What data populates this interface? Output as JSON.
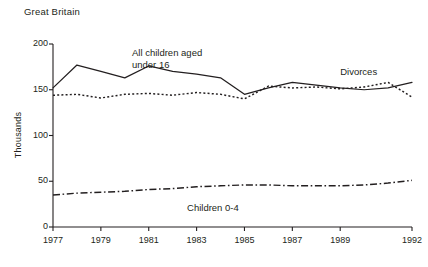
{
  "chart_data": {
    "type": "line",
    "title": "Great Britain",
    "xlabel": "",
    "ylabel": "Thousands",
    "xlim": [
      1977,
      1992
    ],
    "ylim": [
      0,
      200
    ],
    "grid": false,
    "legend_position": "inline-annotations",
    "y_ticks": [
      "0",
      "50",
      "100",
      "150",
      "200"
    ],
    "y_tick_values": [
      0,
      50,
      100,
      150,
      200
    ],
    "x_ticks": [
      "1977",
      "1979",
      "1981",
      "1983",
      "1985",
      "1987",
      "1989",
      "1992"
    ],
    "x_tick_values": [
      1977,
      1979,
      1981,
      1983,
      1985,
      1987,
      1989,
      1992
    ],
    "x": [
      1977,
      1978,
      1979,
      1980,
      1981,
      1982,
      1983,
      1984,
      1985,
      1986,
      1987,
      1988,
      1989,
      1990,
      1991,
      1992
    ],
    "series": [
      {
        "name": "All children aged under 16",
        "style": "solid",
        "color": "#231f20",
        "annotation": "All children aged\nunder 16",
        "values": [
          152,
          177,
          170,
          163,
          176,
          170,
          167,
          163,
          145,
          152,
          158,
          155,
          152,
          150,
          152,
          158
        ]
      },
      {
        "name": "Divorces",
        "style": "dotted",
        "color": "#231f20",
        "annotation": "Divorces",
        "values": [
          144,
          145,
          141,
          145,
          146,
          144,
          147,
          145,
          140,
          154,
          152,
          153,
          151,
          153,
          158,
          142
        ]
      },
      {
        "name": "Children 0-4",
        "style": "dash-dot",
        "color": "#231f20",
        "annotation": "Children 0-4",
        "values": [
          35,
          37,
          38,
          39,
          41,
          42,
          44,
          45,
          46,
          46,
          45,
          45,
          45,
          46,
          48,
          51
        ]
      }
    ]
  },
  "annotations": {
    "children_under16": "All children aged\nunder 16",
    "divorces": "Divorces",
    "children_0_4": "Children 0-4"
  },
  "axes": {
    "y_axis_label": "Thousands",
    "region_label": "Great Britain"
  }
}
